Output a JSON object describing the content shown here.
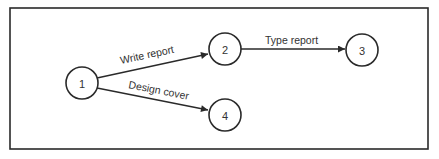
{
  "diagram": {
    "type": "activity-on-arrow network",
    "nodes": [
      {
        "id": "1",
        "label": "1",
        "cx": 82,
        "cy": 83
      },
      {
        "id": "2",
        "label": "2",
        "cx": 225,
        "cy": 49
      },
      {
        "id": "3",
        "label": "3",
        "cx": 362,
        "cy": 50
      },
      {
        "id": "4",
        "label": "4",
        "cx": 225,
        "cy": 115
      }
    ],
    "edges": [
      {
        "from": "1",
        "to": "2",
        "label": "Write report"
      },
      {
        "from": "2",
        "to": "3",
        "label": "Type report"
      },
      {
        "from": "1",
        "to": "4",
        "label": "Design cover"
      }
    ]
  }
}
